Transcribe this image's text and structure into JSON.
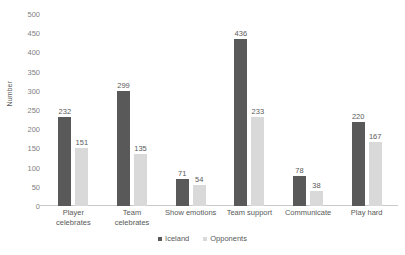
{
  "chart_data": {
    "type": "bar",
    "title": "",
    "xlabel": "",
    "ylabel": "Number",
    "ylim": [
      0,
      500
    ],
    "yticks": [
      0,
      50,
      100,
      150,
      200,
      250,
      300,
      350,
      400,
      450,
      500
    ],
    "ytick_labels": [
      "0",
      "50",
      "100",
      "150",
      "200",
      "250",
      "300",
      "350",
      "400",
      "450",
      "500"
    ],
    "grid": false,
    "legend_position": "bottom",
    "data_labels": true,
    "categories": [
      "Player\ncelebrates",
      "Team\ncelebrates",
      "Show emotions",
      "Team support",
      "Communicate",
      "Play hard"
    ],
    "series": [
      {
        "name": "Iceland",
        "color": "#595959",
        "values": [
          232,
          299,
          71,
          436,
          78,
          220
        ]
      },
      {
        "name": "Opponents",
        "color": "#d9d9d9",
        "values": [
          151,
          135,
          54,
          233,
          38,
          167
        ]
      }
    ]
  }
}
